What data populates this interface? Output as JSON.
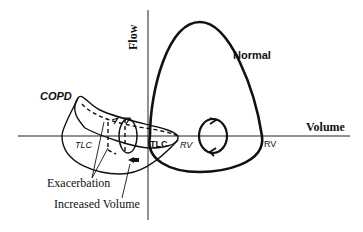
{
  "diagram": {
    "axes": {
      "y_label": "Flow",
      "x_label": "Volume"
    },
    "curves": {
      "normal": {
        "label": "Normal",
        "tlc_label": "TLC",
        "rv_label": "RV"
      },
      "copd": {
        "label": "COPD",
        "tlc_label": "TLC",
        "rv_label": "RV"
      }
    },
    "annotations": {
      "exacerbation": "Exacerbation",
      "increased_volume": "Increased Volume"
    }
  }
}
